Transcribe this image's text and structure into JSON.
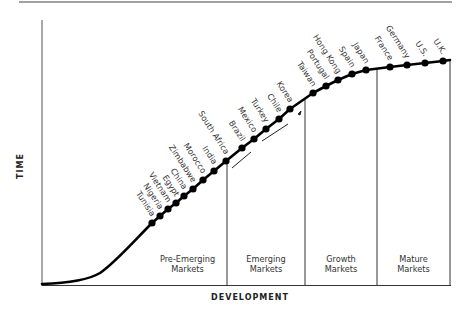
{
  "chart_data": {
    "type": "line",
    "title": "",
    "xlabel": "DEVELOPMENT",
    "ylabel": "TIME",
    "grid": false,
    "legend": null,
    "segments": [
      {
        "label_line1": "Pre-Emerging",
        "label_line2": "Markets",
        "x_start": 148,
        "x_end": 227
      },
      {
        "label_line1": "Emerging",
        "label_line2": "Markets",
        "x_start": 227,
        "x_end": 305
      },
      {
        "label_line1": "Growth",
        "label_line2": "Markets",
        "x_start": 305,
        "x_end": 377
      },
      {
        "label_line1": "Mature",
        "label_line2": "Markets",
        "x_start": 377,
        "x_end": 450
      }
    ],
    "points": [
      {
        "name": "Tunisia",
        "x": 152,
        "y": 223
      },
      {
        "name": "Nigeria",
        "x": 160,
        "y": 216
      },
      {
        "name": "Vietnam",
        "x": 168,
        "y": 209
      },
      {
        "name": "Egypt",
        "x": 176,
        "y": 203
      },
      {
        "name": "China",
        "x": 184,
        "y": 196
      },
      {
        "name": "Zimbabwe",
        "x": 193,
        "y": 189
      },
      {
        "name": "Morocco",
        "x": 203,
        "y": 180
      },
      {
        "name": "India",
        "x": 214,
        "y": 171
      },
      {
        "name": "South Africa",
        "x": 226,
        "y": 161
      },
      {
        "name": "Brazil",
        "x": 242,
        "y": 148
      },
      {
        "name": "Mexico",
        "x": 254,
        "y": 139
      },
      {
        "name": "Turkey",
        "x": 266,
        "y": 129
      },
      {
        "name": "Chile",
        "x": 279,
        "y": 119
      },
      {
        "name": "Korea",
        "x": 290,
        "y": 109
      },
      {
        "name": "Taiwan",
        "x": 313,
        "y": 93
      },
      {
        "name": "Portugal",
        "x": 326,
        "y": 86
      },
      {
        "name": "Hong Kong",
        "x": 338,
        "y": 80
      },
      {
        "name": "Spain",
        "x": 352,
        "y": 74
      },
      {
        "name": "Japan",
        "x": 366,
        "y": 70
      },
      {
        "name": "France",
        "x": 390,
        "y": 67
      },
      {
        "name": "Germany",
        "x": 407,
        "y": 65
      },
      {
        "name": "U.S.",
        "x": 425,
        "y": 63
      },
      {
        "name": "U.K.",
        "x": 443,
        "y": 61
      }
    ]
  },
  "labels": {
    "x_axis": "DEVELOPMENT",
    "y_axis": "TIME"
  }
}
